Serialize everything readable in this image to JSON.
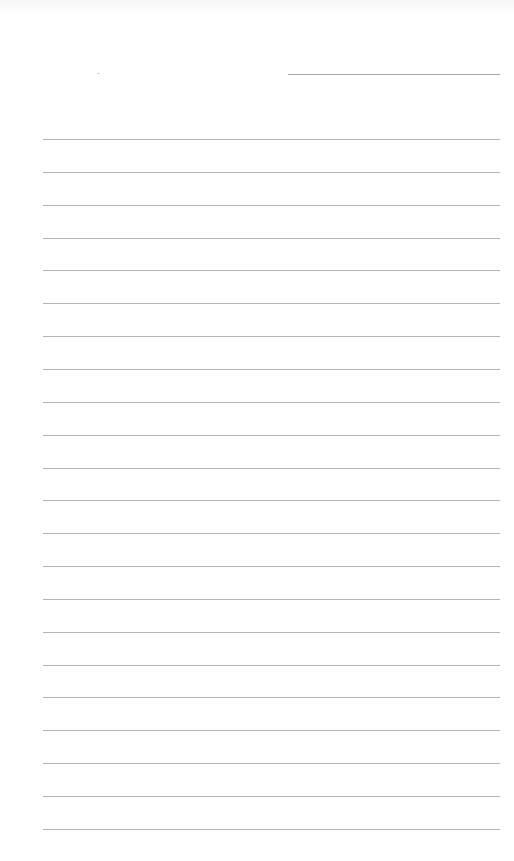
{
  "page": {
    "type": "lined-notepad-page",
    "background": "#ffffff",
    "rule_color": "#b4b4b4",
    "date_line": {
      "label": ""
    },
    "ruled_lines": {
      "count": 22,
      "first_y": 139,
      "spacing": 32.85
    },
    "lines_text": [
      "",
      "",
      "",
      "",
      "",
      "",
      "",
      "",
      "",
      "",
      "",
      "",
      "",
      "",
      "",
      "",
      "",
      "",
      "",
      "",
      "",
      ""
    ]
  }
}
